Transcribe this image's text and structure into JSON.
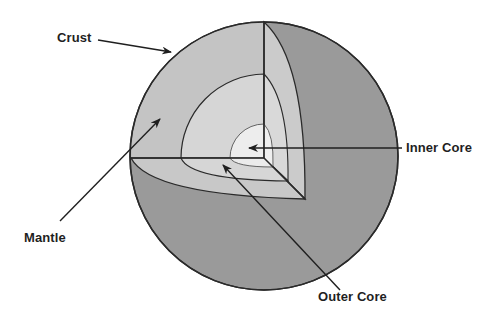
{
  "diagram": {
    "labels": {
      "crust": "Crust",
      "mantle": "Mantle",
      "outer_core": "Outer Core",
      "inner_core": "Inner Core"
    },
    "colors": {
      "background": "#ffffff",
      "sphere_surface": "#9a9a9a",
      "crust_mantle_cut": "#c8c8c8",
      "outer_core_cut": "#d6d6d6",
      "inner_core_cut": "#ececec",
      "outline": "#2a2a2a",
      "arrow": "#1f1f1f"
    }
  }
}
